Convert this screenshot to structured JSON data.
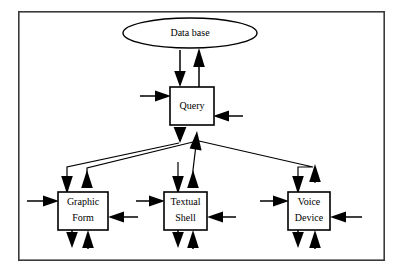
{
  "diagram": {
    "background_color": "#ffffff",
    "line_color": "#000000",
    "frame_color": "#3a3a3a",
    "nodes": [
      {
        "id": "database",
        "label": "Data base",
        "shape": "ellipse",
        "cx": 190,
        "cy": 33,
        "rx": 67,
        "ry": 15
      },
      {
        "id": "query",
        "label": "Query",
        "shape": "rect",
        "x": 170,
        "y": 87,
        "w": 44,
        "h": 38
      },
      {
        "id": "graphic-form",
        "label_line1": "Graphic",
        "label_line2": "Form",
        "shape": "rect",
        "x": 58,
        "y": 192,
        "w": 50,
        "h": 38
      },
      {
        "id": "textual-shell",
        "label_line1": "Textual",
        "label_line2": "Shell",
        "shape": "rect",
        "x": 164,
        "y": 192,
        "w": 43,
        "h": 38
      },
      {
        "id": "voice-device",
        "label_line1": "Voice",
        "label_line2": "Device",
        "shape": "rect",
        "x": 288,
        "y": 192,
        "w": 42,
        "h": 38
      }
    ],
    "frame": {
      "x": 18,
      "y": 11,
      "w": 367,
      "h": 250
    },
    "edges": [
      {
        "id": "db-to-query",
        "from": "database",
        "to": "query",
        "direction": "down"
      },
      {
        "id": "query-to-db",
        "from": "query",
        "to": "database",
        "direction": "up"
      },
      {
        "id": "query-in-left",
        "from": "external",
        "to": "query",
        "direction": "right"
      },
      {
        "id": "query-in-right",
        "from": "external",
        "to": "query",
        "direction": "left"
      },
      {
        "id": "query-to-graphic",
        "from": "query",
        "to": "graphic-form",
        "direction": "down"
      },
      {
        "id": "graphic-to-query",
        "from": "graphic-form",
        "to": "query",
        "direction": "up"
      },
      {
        "id": "query-to-textual",
        "from": "query",
        "to": "textual-shell",
        "direction": "down"
      },
      {
        "id": "textual-to-query",
        "from": "textual-shell",
        "to": "query",
        "direction": "up"
      },
      {
        "id": "query-to-voice",
        "from": "query",
        "to": "voice-device",
        "direction": "down"
      },
      {
        "id": "voice-to-query",
        "from": "voice-device",
        "to": "query",
        "direction": "up"
      },
      {
        "id": "graphic-in-left",
        "from": "external",
        "to": "graphic-form",
        "direction": "right"
      },
      {
        "id": "graphic-in-right",
        "from": "external",
        "to": "graphic-form",
        "direction": "left"
      },
      {
        "id": "graphic-out-down",
        "from": "graphic-form",
        "to": "external",
        "direction": "down"
      },
      {
        "id": "graphic-in-up",
        "from": "external",
        "to": "graphic-form",
        "direction": "up"
      },
      {
        "id": "textual-in-left",
        "from": "external",
        "to": "textual-shell",
        "direction": "right"
      },
      {
        "id": "textual-in-right",
        "from": "external",
        "to": "textual-shell",
        "direction": "left"
      },
      {
        "id": "textual-out-down",
        "from": "textual-shell",
        "to": "external",
        "direction": "down"
      },
      {
        "id": "textual-in-up",
        "from": "external",
        "to": "textual-shell",
        "direction": "up"
      },
      {
        "id": "voice-in-left",
        "from": "external",
        "to": "voice-device",
        "direction": "right"
      },
      {
        "id": "voice-in-right",
        "from": "external",
        "to": "voice-device",
        "direction": "left"
      },
      {
        "id": "voice-out-down",
        "from": "voice-device",
        "to": "external",
        "direction": "down"
      },
      {
        "id": "voice-in-up",
        "from": "external",
        "to": "voice-device",
        "direction": "up"
      }
    ]
  }
}
